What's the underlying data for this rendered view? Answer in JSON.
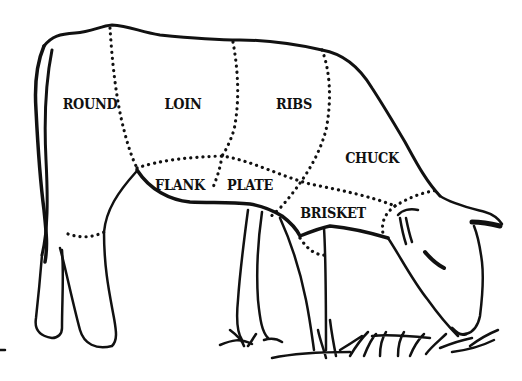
{
  "diagram": {
    "line_color": "#111111",
    "background": "#ffffff",
    "cuts": [
      {
        "id": "round",
        "label": "ROUND",
        "x": 90,
        "y": 104
      },
      {
        "id": "loin",
        "label": "LOIN",
        "x": 183,
        "y": 104
      },
      {
        "id": "ribs",
        "label": "RIBS",
        "x": 294,
        "y": 104
      },
      {
        "id": "chuck",
        "label": "CHUCK",
        "x": 372,
        "y": 158
      },
      {
        "id": "flank",
        "label": "FLANK",
        "x": 180,
        "y": 185
      },
      {
        "id": "plate",
        "label": "PLATE",
        "x": 250,
        "y": 185
      },
      {
        "id": "brisket",
        "label": "BRISKET",
        "x": 333,
        "y": 213
      }
    ]
  }
}
